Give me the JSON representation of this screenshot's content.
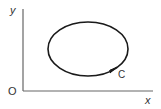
{
  "diagram": {
    "axes": {
      "y_label": "y",
      "x_label": "x",
      "origin_label": "O"
    },
    "curve": {
      "shape": "closed-ellipse",
      "label": "C",
      "direction": "counterclockwise",
      "arrow_icon": "arrowhead-icon"
    },
    "colors": {
      "stroke": "#1a1a1a",
      "axis": "#555555",
      "text": "#333333"
    }
  }
}
